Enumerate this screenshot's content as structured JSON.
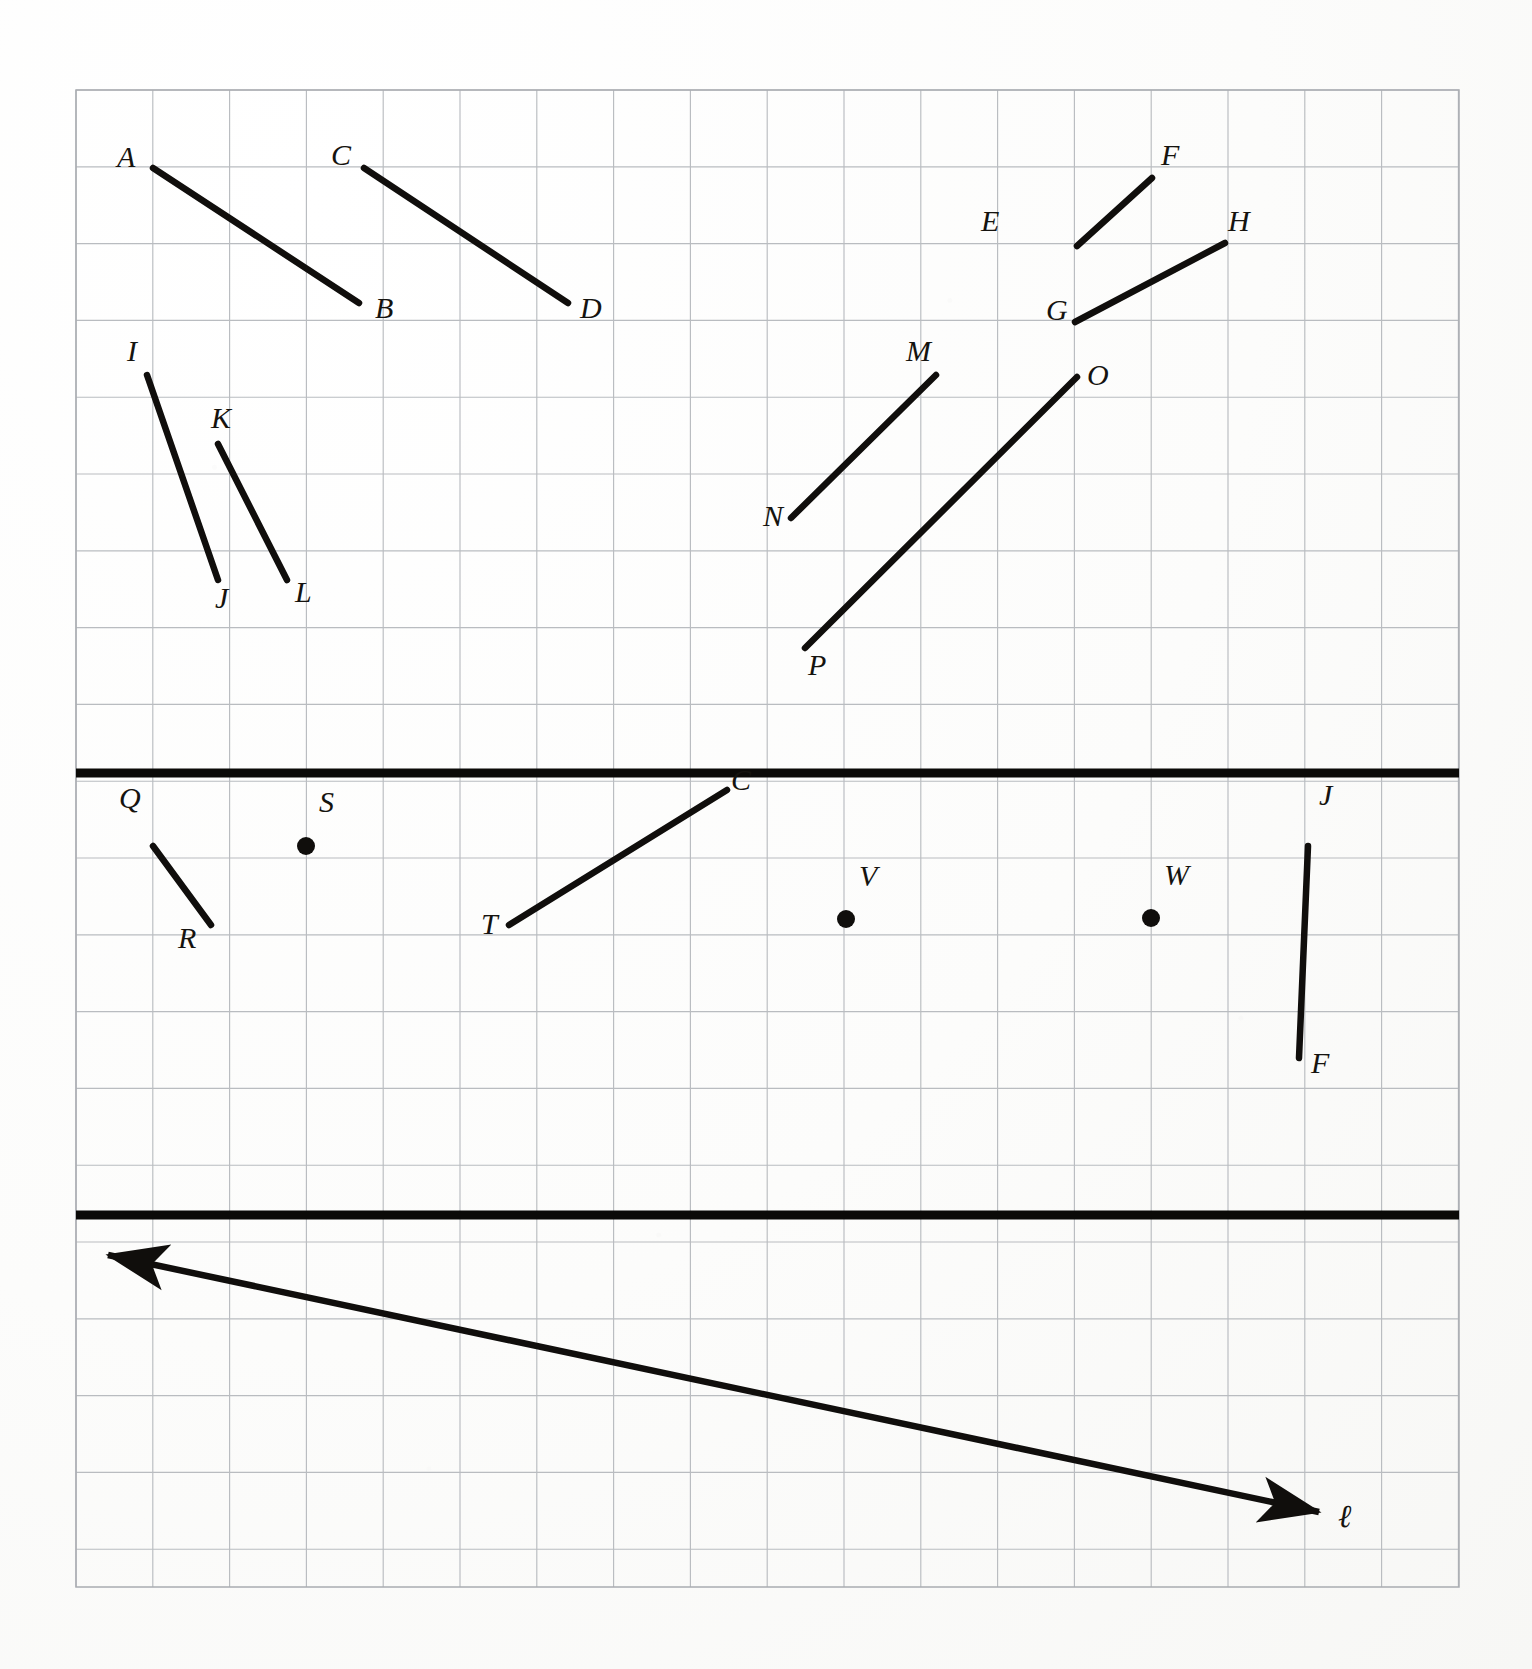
{
  "document": {
    "kind": "geometry-worksheet-figure",
    "description": "Graph-paper figure divided by two heavy horizontal rules into three panels: a panel of eight labeled line segments, a panel of three labeled segments plus three labeled points, and a panel containing one double-headed line labeled script-l."
  },
  "grid": {
    "left": 76,
    "top": 90,
    "right": 1459,
    "bottom": 1587,
    "cell": 76.8,
    "minor_color": "#b9bcc0",
    "border_color": "#a9acb1"
  },
  "dividers": [
    {
      "name": "divider-top",
      "y": 773,
      "color": "#0b0a08",
      "thickness": 9
    },
    {
      "name": "divider-bottom",
      "y": 1215,
      "color": "#0b0a08",
      "thickness": 9
    }
  ],
  "panels": [
    {
      "id": "panel-segments-top",
      "segments": [
        {
          "id": "AB",
          "from_label": "A",
          "to_label": "B",
          "x1": 153,
          "y1": 168,
          "x2": 359,
          "y2": 303,
          "label_from": {
            "text": "A",
            "x": 117,
            "y": 167
          },
          "label_to": {
            "text": "B",
            "x": 375,
            "y": 318
          }
        },
        {
          "id": "CD",
          "from_label": "C",
          "to_label": "D",
          "x1": 364,
          "y1": 168,
          "x2": 568,
          "y2": 303,
          "label_from": {
            "text": "C",
            "x": 331,
            "y": 165
          },
          "label_to": {
            "text": "D",
            "x": 580,
            "y": 318
          }
        },
        {
          "id": "EF",
          "from_label": "E",
          "to_label": "F",
          "x1": 1077,
          "y1": 246,
          "x2": 1152,
          "y2": 178,
          "label_from": {
            "text": "E",
            "x": 981,
            "y": 231
          },
          "label_to": {
            "text": "F",
            "x": 1161,
            "y": 165
          }
        },
        {
          "id": "GH",
          "from_label": "G",
          "to_label": "H",
          "x1": 1075,
          "y1": 322,
          "x2": 1225,
          "y2": 243,
          "label_from": {
            "text": "G",
            "x": 1046,
            "y": 320
          },
          "label_to": {
            "text": "H",
            "x": 1228,
            "y": 231
          }
        },
        {
          "id": "IJ",
          "from_label": "I",
          "to_label": "J",
          "x1": 147,
          "y1": 375,
          "x2": 218,
          "y2": 580,
          "label_from": {
            "text": "I",
            "x": 127,
            "y": 361
          },
          "label_to": {
            "text": "J",
            "x": 215,
            "y": 608
          }
        },
        {
          "id": "KL",
          "from_label": "K",
          "to_label": "L",
          "x1": 218,
          "y1": 444,
          "x2": 287,
          "y2": 580,
          "label_from": {
            "text": "K",
            "x": 211,
            "y": 428
          },
          "label_to": {
            "text": "L",
            "x": 295,
            "y": 602
          }
        },
        {
          "id": "MN",
          "from_label": "M",
          "to_label": "N",
          "x1": 936,
          "y1": 375,
          "x2": 791,
          "y2": 518,
          "label_from": {
            "text": "M",
            "x": 906,
            "y": 361
          },
          "label_to": {
            "text": "N",
            "x": 763,
            "y": 526
          }
        },
        {
          "id": "OP",
          "from_label": "O",
          "to_label": "P",
          "x1": 1077,
          "y1": 377,
          "x2": 805,
          "y2": 648,
          "label_from": {
            "text": "O",
            "x": 1087,
            "y": 385
          },
          "label_to": {
            "text": "P",
            "x": 808,
            "y": 675
          }
        }
      ],
      "points": []
    },
    {
      "id": "panel-segments-points-middle",
      "segments": [
        {
          "id": "QR",
          "from_label": "Q",
          "to_label": "R",
          "x1": 153,
          "y1": 846,
          "x2": 211,
          "y2": 925,
          "label_from": {
            "text": "Q",
            "x": 119,
            "y": 808
          },
          "label_to": {
            "text": "R",
            "x": 178,
            "y": 948
          }
        },
        {
          "id": "TC",
          "from_label": "T",
          "to_label": "C",
          "x1": 509,
          "y1": 925,
          "x2": 727,
          "y2": 790,
          "label_from": {
            "text": "T",
            "x": 481,
            "y": 934
          },
          "label_to": {
            "text": "C",
            "x": 731,
            "y": 790
          }
        },
        {
          "id": "JF",
          "from_label": "J",
          "to_label": "F",
          "x1": 1308,
          "y1": 846,
          "x2": 1299,
          "y2": 1058,
          "label_from": {
            "text": "J",
            "x": 1319,
            "y": 805
          },
          "label_to": {
            "text": "F",
            "x": 1311,
            "y": 1073
          }
        }
      ],
      "points": [
        {
          "id": "S",
          "x": 306,
          "y": 846,
          "r": 9,
          "label": {
            "text": "S",
            "x": 319,
            "y": 812
          }
        },
        {
          "id": "V",
          "x": 846,
          "y": 919,
          "r": 9,
          "label": {
            "text": "V",
            "x": 859,
            "y": 886
          }
        },
        {
          "id": "W",
          "x": 1151,
          "y": 918,
          "r": 9,
          "label": {
            "text": "W",
            "x": 1164,
            "y": 885
          }
        }
      ]
    },
    {
      "id": "panel-line-bottom",
      "lines": [
        {
          "id": "ell",
          "label": "ℓ",
          "x1": 108,
          "y1": 1255,
          "x2": 1319,
          "y2": 1512,
          "arrow_start": true,
          "arrow_end": true,
          "label_pos": {
            "x": 1338,
            "y": 1527
          }
        }
      ],
      "segments": [],
      "points": []
    }
  ],
  "labels": {
    "point_labels": [
      "A",
      "B",
      "C",
      "D",
      "E",
      "F",
      "G",
      "H",
      "I",
      "J",
      "K",
      "L",
      "M",
      "N",
      "O",
      "P",
      "Q",
      "R",
      "S",
      "T",
      "V",
      "W",
      "C",
      "J",
      "F"
    ],
    "line_labels": [
      "ℓ"
    ]
  },
  "colors": {
    "ink": "#100e0c",
    "grid": "#b9bcc0",
    "paper": "#fcfcfb"
  }
}
